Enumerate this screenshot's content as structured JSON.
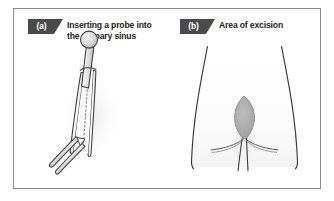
{
  "figure": {
    "background_color": "#ffffff",
    "border_color": "#8d8d8d",
    "badge_color": "#4a4a4a",
    "ink_color": "#3a3a3a",
    "excision_fill": "#a8a8a8"
  },
  "panels": [
    {
      "id": "a",
      "badge_label": "(a)",
      "caption": "Inserting a probe into\nthe primary sinus",
      "illustration": {
        "name": "probe-in-sinus-tract",
        "elements": [
          "ball-tipped-probe",
          "sinus-tract-tube",
          "dotted-probe-path",
          "secondary-tract-opening"
        ]
      }
    },
    {
      "id": "b",
      "badge_label": "(b)",
      "caption": "Area of excision",
      "illustration": {
        "name": "buttocks-area-of-excision",
        "elements": [
          "body-outline-left",
          "body-outline-right",
          "natal-cleft-line",
          "gluteal-fold-lines",
          "excision-ellipse"
        ]
      }
    }
  ]
}
